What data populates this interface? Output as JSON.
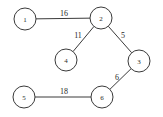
{
  "figure": {
    "type": "weighted-undirected-graph",
    "background_color": "#ffffff",
    "line_color": "#3a3a3a",
    "text_color": "#1f1f1f",
    "width": 163,
    "height": 117
  },
  "chart_data": {
    "type": "diagram",
    "title": "",
    "nodes": [
      {
        "id": "1",
        "label": "1",
        "x": 25,
        "y": 19,
        "r": 11
      },
      {
        "id": "2",
        "label": "2",
        "x": 101,
        "y": 18,
        "r": 11
      },
      {
        "id": "3",
        "label": "3",
        "x": 139,
        "y": 61,
        "r": 11
      },
      {
        "id": "4",
        "label": "4",
        "x": 66,
        "y": 60,
        "r": 11
      },
      {
        "id": "5",
        "label": "5",
        "x": 24,
        "y": 97,
        "r": 11
      },
      {
        "id": "6",
        "label": "6",
        "x": 102,
        "y": 97,
        "r": 11
      }
    ],
    "edges": [
      {
        "source": "1",
        "target": "2",
        "weight": "16",
        "label_x": 64,
        "label_y": 13
      },
      {
        "source": "2",
        "target": "4",
        "weight": "11",
        "label_x": 78,
        "label_y": 35
      },
      {
        "source": "2",
        "target": "3",
        "weight": "5",
        "label_x": 123,
        "label_y": 35
      },
      {
        "source": "3",
        "target": "6",
        "weight": "6",
        "label_x": 117,
        "label_y": 77
      },
      {
        "source": "5",
        "target": "6",
        "weight": "18",
        "label_x": 64,
        "label_y": 91
      }
    ]
  }
}
